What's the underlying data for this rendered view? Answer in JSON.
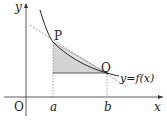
{
  "diagram": {
    "axes": {
      "x_label": "x",
      "y_label": "y",
      "origin_label": "O"
    },
    "points": {
      "P": "P",
      "Q": "Q"
    },
    "ticks": {
      "a": "a",
      "b": "b"
    },
    "curve_label": "y=f(x)",
    "colors": {
      "line": "#333333",
      "shade": "#d4d4d4",
      "dashed": "#666666"
    }
  }
}
